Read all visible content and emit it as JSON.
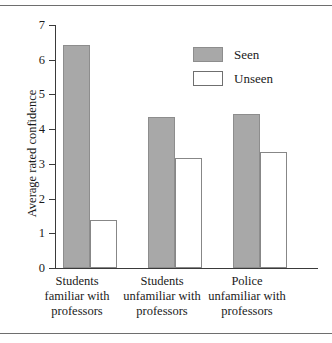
{
  "chart_data": {
    "type": "bar",
    "title": "",
    "xlabel": "",
    "ylabel": "Average rated confidence",
    "ylim": [
      0,
      7
    ],
    "yticks": [
      "0",
      "1",
      "2",
      "3",
      "4",
      "5",
      "6",
      "7"
    ],
    "grid": false,
    "legend_position": "upper-center-right",
    "categories": [
      "Students familiar with professors",
      "Students unfamiliar with professors",
      "Police unfamiliar with professors"
    ],
    "category_lines": [
      [
        "Students",
        "familiar with",
        "professors"
      ],
      [
        "Students",
        "unfamiliar with",
        "professors"
      ],
      [
        "Police",
        "unfamiliar with",
        "professors"
      ]
    ],
    "series": [
      {
        "name": "Seen",
        "color": "#a8a8a8",
        "values": [
          6.42,
          4.35,
          4.45
        ]
      },
      {
        "name": "Unseen",
        "color": "#ffffff",
        "values": [
          1.38,
          3.17,
          3.34
        ]
      }
    ]
  },
  "legend": {
    "items": [
      {
        "label": "Seen"
      },
      {
        "label": "Unseen"
      }
    ]
  },
  "axis": {
    "y_label": "Average rated confidence",
    "y_ticks": [
      "7",
      "6",
      "5",
      "4",
      "3",
      "2",
      "1",
      "0"
    ]
  }
}
